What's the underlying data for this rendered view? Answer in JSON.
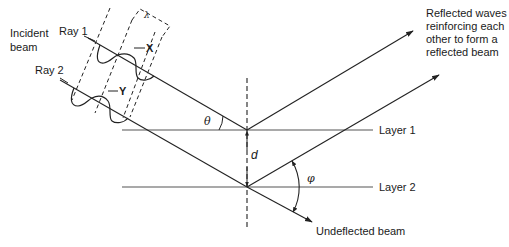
{
  "labels": {
    "incident_beam": "Incident\nbeam",
    "ray1": "Ray 1",
    "ray2": "Ray 2",
    "x_marker": "X",
    "y_marker": "Y",
    "lambda": "λ",
    "theta": "θ",
    "phi": "φ",
    "d": "d",
    "layer1": "Layer 1",
    "layer2": "Layer 2",
    "reflected": "Reflected waves\nreinforcing each\nother to form a\nreflected beam",
    "undeflected": "Undeflected beam"
  },
  "colors": {
    "line": "#2a2a2a",
    "layer": "#555555",
    "background": "#ffffff"
  }
}
